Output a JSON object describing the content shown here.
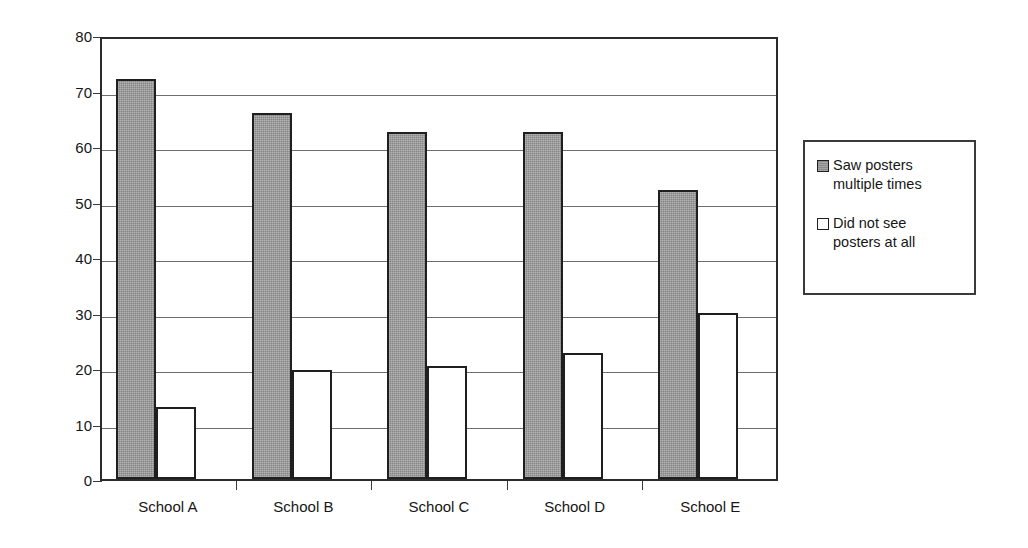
{
  "chart_data": {
    "type": "bar",
    "title": "",
    "xlabel": "",
    "ylabel": "Percent of students",
    "ylim": [
      0,
      80
    ],
    "yticks": [
      0,
      10,
      20,
      30,
      40,
      50,
      60,
      70,
      80
    ],
    "ytick_labels": [
      "0",
      "10",
      "20",
      "30",
      "40",
      "50",
      "60",
      "70",
      "80"
    ],
    "grid": true,
    "legend_position": "right",
    "categories": [
      "School A",
      "School B",
      "School C",
      "School D",
      "School E"
    ],
    "series": [
      {
        "name": "Saw posters multiple times",
        "color": "#949494",
        "swatch": "gray",
        "values": [
          72,
          66,
          62.5,
          62.5,
          52
        ]
      },
      {
        "name": "Did not see posters at all",
        "color": "#ffffff",
        "swatch": "white",
        "values": [
          13,
          19.7,
          20.3,
          22.7,
          30
        ]
      }
    ]
  },
  "legend": {
    "entries": [
      {
        "label_line1": "Saw posters",
        "label_line2": "multiple times",
        "swatch": "gray"
      },
      {
        "label_line1": "Did not see",
        "label_line2": "posters  at all",
        "swatch": "white"
      }
    ]
  },
  "colors": {
    "series_gray": "#949494",
    "series_white": "#ffffff",
    "axis": "#2b2b2b",
    "gridline": "#6e6e6e",
    "text": "#161616",
    "background": "#ffffff"
  }
}
